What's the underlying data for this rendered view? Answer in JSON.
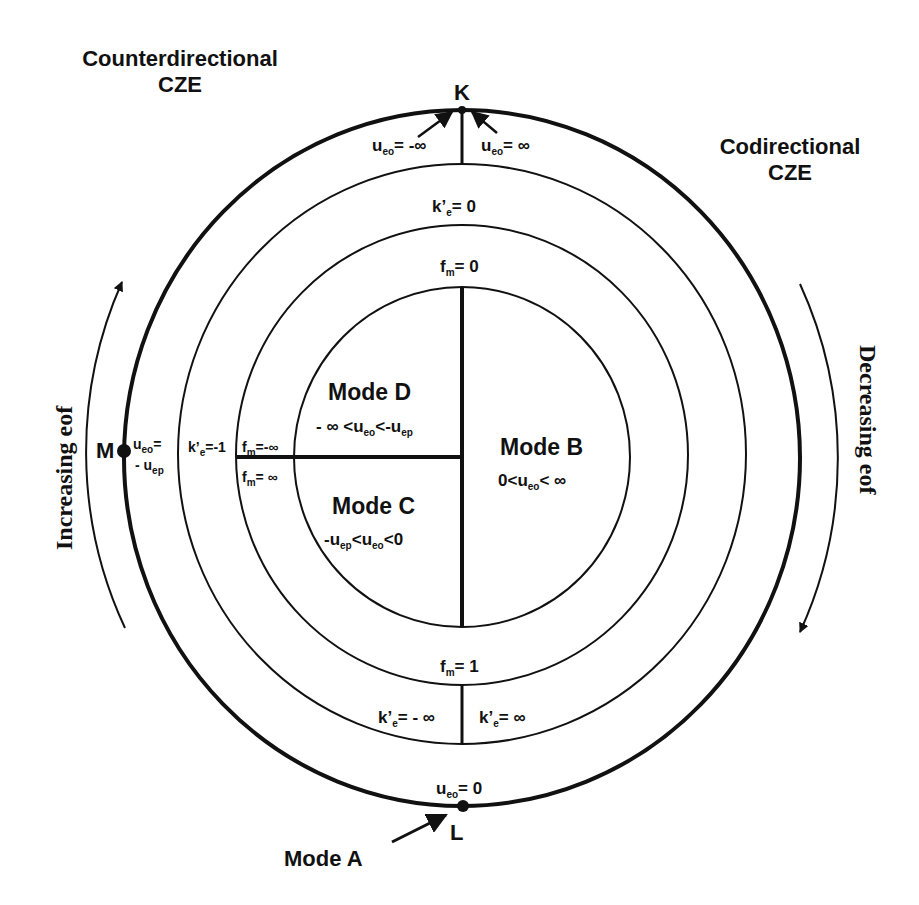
{
  "titles": {
    "counterdirectional_line1": "Counterdirectional",
    "counterdirectional_line2": "CZE",
    "codirectional_line1": "Codirectional",
    "codirectional_line2": "CZE"
  },
  "points": {
    "K": "K",
    "L": "L",
    "M": "M"
  },
  "arrows": {
    "increasing": "Increasing eof",
    "decreasing": "Decreasing eof"
  },
  "outer_ring": {
    "top_left": {
      "var": "u",
      "sub": "eo",
      "rest": "= -∞"
    },
    "top_right": {
      "var": "u",
      "sub": "eo",
      "rest": "= ∞"
    },
    "bottom": {
      "var": "u",
      "sub": "eo",
      "rest": "= 0"
    },
    "left_line1": {
      "var": "u",
      "sub": "eo",
      "rest": "="
    },
    "left_line2": {
      "pre": "- u",
      "sub": "ep"
    }
  },
  "second_ring": {
    "top": {
      "var": "k’",
      "sub": "e",
      "rest": "= 0"
    },
    "left": {
      "var": "k’",
      "sub": "e",
      "rest": "=-1"
    },
    "bottom_left": {
      "var": "k’",
      "sub": "e",
      "rest": "= - ∞"
    },
    "bottom_right": {
      "var": "k’",
      "sub": "e",
      "rest": "= ∞"
    }
  },
  "third_ring": {
    "top": {
      "var": "f",
      "sub": "m",
      "rest": "= 0"
    },
    "left_upper": {
      "var": "f",
      "sub": "m",
      "rest": "=-∞"
    },
    "left_lower": {
      "var": "f",
      "sub": "m",
      "rest": "= ∞"
    },
    "bottom": {
      "var": "f",
      "sub": "m",
      "rest": "= 1"
    }
  },
  "modes": {
    "A": {
      "title": "Mode A"
    },
    "B": {
      "title": "Mode  B",
      "c1": "0<u",
      "s1": "eo",
      "c2": "< ∞"
    },
    "C": {
      "title": "Mode  C",
      "c1": "-u",
      "s1": "ep",
      "c2": "<u",
      "s2": "eo",
      "c3": "<0"
    },
    "D": {
      "title": "Mode  D",
      "c1": "- ∞ <u",
      "s1": "eo",
      "c2": "<-u",
      "s2": "ep"
    }
  }
}
